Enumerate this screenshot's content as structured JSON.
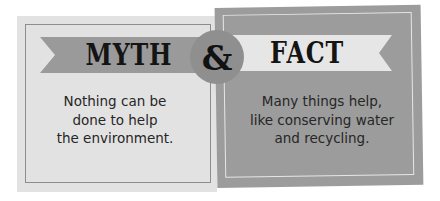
{
  "myth": {
    "title": "MYTH",
    "text_lines": [
      "Nothing can be",
      "done to help",
      "the environment."
    ]
  },
  "connector": {
    "symbol": "&"
  },
  "fact": {
    "title": "FACT",
    "text_lines": [
      "Many things help,",
      "like conserving water",
      "and recycling."
    ]
  },
  "colors": {
    "myth_panel": "#e2e2e2",
    "myth_banner": "#9a9a9a",
    "fact_panel": "#9c9c9c",
    "fact_banner": "#e6e6e6",
    "circle": "#8f8f8f",
    "text": "#262626"
  }
}
